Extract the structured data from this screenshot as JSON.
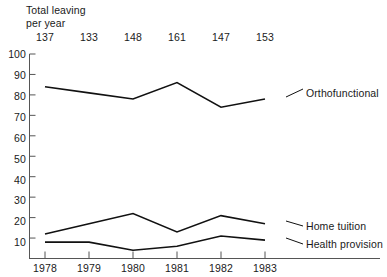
{
  "header": {
    "title_line1": "Total leaving",
    "title_line2": "per year"
  },
  "chart_data": {
    "type": "line",
    "xlabel": "",
    "ylabel": "",
    "categories": [
      "1978",
      "1979",
      "1980",
      "1981",
      "1982",
      "1983"
    ],
    "totals_per_year": [
      137,
      133,
      148,
      161,
      147,
      153
    ],
    "ylim": [
      0,
      100
    ],
    "yticks": [
      0,
      10,
      20,
      30,
      40,
      50,
      60,
      70,
      80,
      90,
      100
    ],
    "ytick_labels": [
      "",
      "10",
      "20",
      "30",
      "40",
      "50",
      "60",
      "70",
      "80",
      "90",
      "100"
    ],
    "grid": false,
    "legend_position": "right-inline",
    "series": [
      {
        "name": "Orthofunctional",
        "values": [
          84,
          81,
          78,
          86,
          74,
          78
        ],
        "color": "#111111"
      },
      {
        "name": "Home tuition",
        "values": [
          12,
          17,
          22,
          13,
          21,
          17
        ],
        "color": "#111111"
      },
      {
        "name": "Health provision",
        "values": [
          8,
          8,
          4,
          6,
          11,
          9
        ],
        "color": "#111111"
      }
    ]
  },
  "axis": {
    "ytick_10": "10",
    "ytick_20": "20",
    "ytick_30": "30",
    "ytick_40": "40",
    "ytick_50": "50",
    "ytick_60": "60",
    "ytick_70": "70",
    "ytick_80": "80",
    "ytick_90": "90",
    "ytick_100": "100"
  },
  "colors": {
    "line": "#111111",
    "axis": "#555555",
    "text": "#1a1a1a",
    "background": "#ffffff"
  }
}
